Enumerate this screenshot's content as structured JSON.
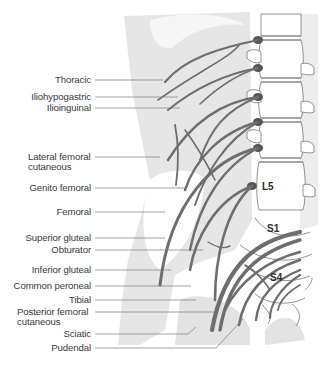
{
  "diagram": {
    "type": "anatomical-illustration",
    "colors": {
      "nerve": "#6e6e6e",
      "nerve_root": "#555555",
      "body_shade": "#e6e6e6",
      "leader_line": "#7a7a7a",
      "label_text": "#3a3a3a"
    },
    "labels": [
      {
        "id": "thoracic",
        "text": "Thoracic"
      },
      {
        "id": "iliohypogastric",
        "text": "Iliohypogastric"
      },
      {
        "id": "ilioinguinal",
        "text": "Ilioinguinal"
      },
      {
        "id": "lateral-femoral-cutaneous",
        "line1": "Lateral femoral",
        "line2": "cutaneous"
      },
      {
        "id": "genito-femoral",
        "text": "Genito femoral"
      },
      {
        "id": "femoral",
        "text": "Femoral"
      },
      {
        "id": "superior-gluteal",
        "text": "Superior gluteal"
      },
      {
        "id": "obturator",
        "text": "Obturator"
      },
      {
        "id": "inferior-gluteal",
        "text": "Inferior gluteal"
      },
      {
        "id": "common-peroneal",
        "text": "Common peroneal"
      },
      {
        "id": "tibial",
        "text": "Tibial"
      },
      {
        "id": "posterior-femoral-cutaneous",
        "line1": "Posterior femoral",
        "line2": "cutaneous"
      },
      {
        "id": "sciatic",
        "text": "Sciatic"
      },
      {
        "id": "pudendal",
        "text": "Pudendal"
      }
    ],
    "vertebra_labels": {
      "l5": "L5",
      "s1": "S1",
      "s4": "S4"
    }
  }
}
